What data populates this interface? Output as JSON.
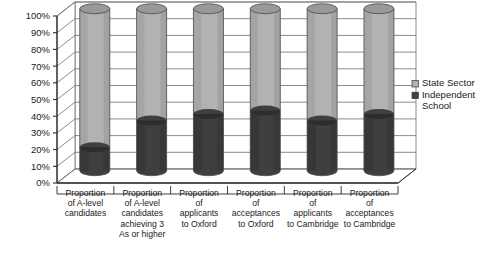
{
  "chart_data": {
    "type": "bar",
    "title": "",
    "subtitle": "",
    "xlabel": "",
    "ylabel": "",
    "stacked": true,
    "stacked_mode": "percent",
    "grid": true,
    "three_d": true,
    "bar_shape": "cylinder",
    "ylim": [
      0,
      100
    ],
    "ytick_labels": [
      "100%",
      "90%",
      "80%",
      "70%",
      "60%",
      "50%",
      "40%",
      "30%",
      "20%",
      "10%",
      "0%"
    ],
    "ytick_values": [
      100,
      90,
      80,
      70,
      60,
      50,
      40,
      30,
      20,
      10,
      0
    ],
    "categories": [
      "Proportion of A-level candidates",
      "Proportion of A-level candidates achieving 3 As or higher",
      "Proportion of applicants to Oxford",
      "Proportion of acceptances to Oxford",
      "Proportion of applicants to Cambridge",
      "Proportion of acceptances to Cambridge"
    ],
    "category_label_lines": [
      [
        "Proportion",
        "of A-level",
        "candidates"
      ],
      [
        "Proportion",
        "of A-level",
        "candidates",
        "achieving 3",
        "As or higher"
      ],
      [
        "Proportion",
        "of",
        "applicants",
        "to Oxford"
      ],
      [
        "Proportion",
        "of",
        "acceptances",
        "to Oxford"
      ],
      [
        "Proportion",
        "of",
        "applicants",
        "to Cambridge"
      ],
      [
        "Proportion",
        "of",
        "acceptances",
        "to Cambridge"
      ]
    ],
    "legend_position": "right",
    "series": [
      {
        "name": "State Sector",
        "color": "#b2b2b2",
        "values": [
          83,
          67,
          63,
          61,
          67,
          63
        ]
      },
      {
        "name": "Independent School",
        "color": "#3f3f3f",
        "values": [
          17,
          33,
          37,
          39,
          33,
          37
        ]
      }
    ]
  },
  "legend": {
    "items": [
      {
        "label": "State Sector",
        "color": "#b2b2b2"
      },
      {
        "label": "Independent School",
        "color": "#3f3f3f"
      }
    ],
    "item_label_lines": [
      [
        "State Sector"
      ],
      [
        "Independent",
        "School"
      ]
    ]
  },
  "colors": {
    "state_sector": "#b2b2b2",
    "independent_school": "#3f3f3f",
    "axis": "#2b2b2b",
    "gridline": "#6e6e6e",
    "wall": "#ffffff",
    "text": "#1a1a1a"
  }
}
